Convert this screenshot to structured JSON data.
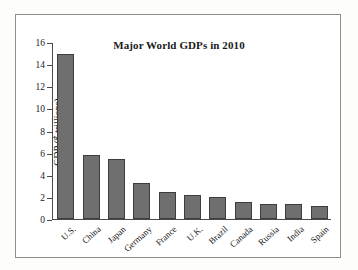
{
  "figure": {
    "title": "Major World GDPs in 2010",
    "frame_color": "#8d8d8d",
    "background": "#ffffff"
  },
  "chart_data": {
    "type": "bar",
    "title": "Major World GDPs in 2010",
    "xlabel": "",
    "ylabel": "GDP ($ trillions)",
    "categories": [
      "U.S.",
      "China",
      "Japan",
      "Germany",
      "France",
      "U.K.",
      "Brazil",
      "Canada",
      "Russia",
      "India",
      "Spain"
    ],
    "values": [
      14.9,
      5.8,
      5.45,
      3.3,
      2.45,
      2.2,
      2.0,
      1.5,
      1.4,
      1.35,
      1.2
    ],
    "ylim": [
      0,
      16
    ],
    "yticks": [
      0,
      2,
      4,
      6,
      8,
      10,
      12,
      14,
      16
    ],
    "ytick_labels": [
      "0",
      "2",
      "4",
      "6",
      "8",
      "10",
      "12",
      "14",
      "16"
    ],
    "grid": false,
    "legend": null,
    "bar_color": "#6f6f6f",
    "bar_edge_color": "#3d3d3d",
    "axis_color": "#4a4a4a"
  }
}
